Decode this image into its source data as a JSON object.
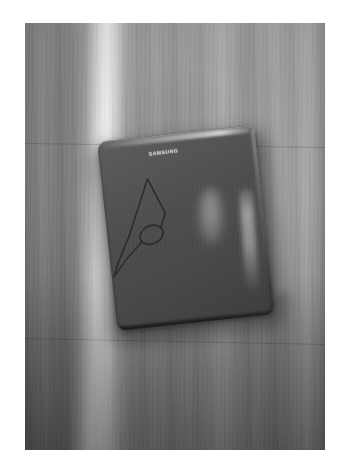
{
  "photo": {
    "title": "Photograph of a laptop on a wooden floor",
    "subject": "dark gray laptop computer lying closed on a wooden plank floor",
    "orientation": "portrait",
    "color_mode": "grayscale",
    "border": {
      "style": "white photo margin",
      "color": "#ffffff",
      "top_px": 23,
      "bottom_px": 18,
      "left_px": 25,
      "right_px": 24
    },
    "scene": {
      "background_name": "wooden-floor",
      "background_description": "vertical wood plank grain running top to bottom with a bright diagonal light streak on the left side",
      "background_base_color": "#8d8d8d",
      "light_streak_color": "#dcdcdc",
      "lower_floor_shade": "darker gray wash toward the bottom of the frame"
    },
    "object": {
      "name": "laptop",
      "description": "closed laptop lid seen from above, rotated slightly counter-clockwise",
      "body_color": "#4e4e4e",
      "edge_highlight_color": "#ffffff",
      "logo_text": "SAMSUNG",
      "features": [
        "specular highlight along the top edge of the lid",
        "soft oval reflection near the center of the lid",
        "long vertical reflection near the right edge of the lid",
        "thin cable looped across the lower-left corner of the lid",
        "drop shadow cast onto the floor beneath the laptop"
      ]
    },
    "cable": {
      "name": "power-cable",
      "description": "thin dark cable forming a triangular loop over the left portion of the lid",
      "color": "#2a2a2a"
    }
  }
}
